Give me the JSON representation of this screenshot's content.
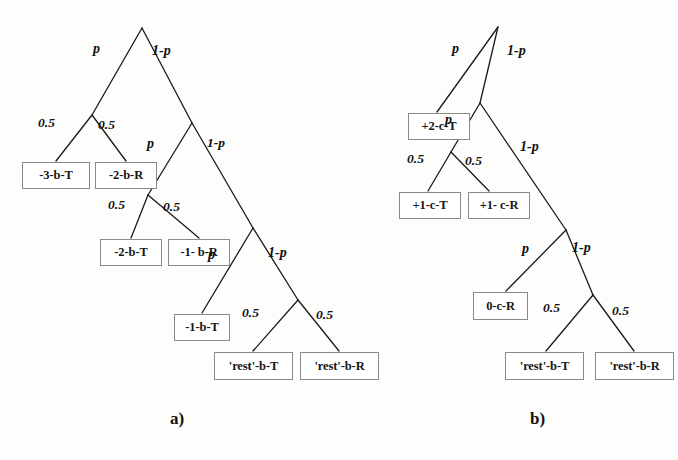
{
  "figure": {
    "width": 678,
    "height": 460,
    "background_color": "#fdfdfc",
    "line_color": "#1a1a1a",
    "box_border_color": "#8a8a86",
    "text_color": "#161616"
  },
  "panels": [
    {
      "id": "a",
      "caption": "a)",
      "caption_x": 170,
      "caption_y": 410,
      "nodes": [
        {
          "label": "-3-b-T",
          "x": 22,
          "y": 162,
          "w": 68,
          "h": 27
        },
        {
          "label": "-2-b-R",
          "x": 95,
          "y": 162,
          "w": 62,
          "h": 27
        },
        {
          "label": "-2-b-T",
          "x": 100,
          "y": 239,
          "w": 62,
          "h": 27
        },
        {
          "label": "-1- b-R",
          "x": 168,
          "y": 239,
          "w": 62,
          "h": 27
        },
        {
          "label": "-1-b-T",
          "x": 174,
          "y": 314,
          "w": 56,
          "h": 27
        },
        {
          "label": "'rest'-b-T",
          "x": 214,
          "y": 352,
          "w": 79,
          "h": 28
        },
        {
          "label": "'rest'-b-R",
          "x": 300,
          "y": 352,
          "w": 79,
          "h": 28
        }
      ],
      "edge_labels": [
        {
          "text": "p",
          "x": 93,
          "y": 42,
          "kind": "symbol"
        },
        {
          "text": "1-p",
          "x": 152,
          "y": 44,
          "kind": "symbol"
        },
        {
          "text": "0.5",
          "x": 38,
          "y": 116,
          "kind": "number"
        },
        {
          "text": "0.5",
          "x": 98,
          "y": 118,
          "kind": "number"
        },
        {
          "text": "p",
          "x": 147,
          "y": 137,
          "kind": "symbol"
        },
        {
          "text": "1-p",
          "x": 207,
          "y": 136,
          "kind": "number"
        },
        {
          "text": "0.5",
          "x": 108,
          "y": 198,
          "kind": "number"
        },
        {
          "text": "0.5",
          "x": 163,
          "y": 200,
          "kind": "number"
        },
        {
          "text": "p",
          "x": 208,
          "y": 248,
          "kind": "symbol"
        },
        {
          "text": "1-p",
          "x": 268,
          "y": 246,
          "kind": "symbol"
        },
        {
          "text": "0.5",
          "x": 242,
          "y": 306,
          "kind": "number"
        },
        {
          "text": "0.5",
          "x": 316,
          "y": 308,
          "kind": "number"
        }
      ],
      "edges": [
        {
          "x1": 142,
          "y1": 28,
          "x2": 92,
          "y2": 115
        },
        {
          "x1": 142,
          "y1": 28,
          "x2": 192,
          "y2": 123
        },
        {
          "x1": 92,
          "y1": 115,
          "x2": 56,
          "y2": 161
        },
        {
          "x1": 92,
          "y1": 115,
          "x2": 126,
          "y2": 161
        },
        {
          "x1": 192,
          "y1": 123,
          "x2": 148,
          "y2": 195
        },
        {
          "x1": 192,
          "y1": 123,
          "x2": 253,
          "y2": 228
        },
        {
          "x1": 148,
          "y1": 195,
          "x2": 131,
          "y2": 238
        },
        {
          "x1": 148,
          "y1": 195,
          "x2": 199,
          "y2": 238
        },
        {
          "x1": 253,
          "y1": 228,
          "x2": 202,
          "y2": 313
        },
        {
          "x1": 253,
          "y1": 228,
          "x2": 298,
          "y2": 300
        },
        {
          "x1": 298,
          "y1": 300,
          "x2": 253,
          "y2": 351
        },
        {
          "x1": 298,
          "y1": 300,
          "x2": 339,
          "y2": 351
        }
      ]
    },
    {
      "id": "b",
      "caption": "b)",
      "caption_x": 530,
      "caption_y": 410,
      "nodes": [
        {
          "label": "+2-c-T",
          "x": 408,
          "y": 113,
          "w": 62,
          "h": 27
        },
        {
          "label": "+1-c-T",
          "x": 399,
          "y": 192,
          "w": 62,
          "h": 27
        },
        {
          "label": "+1- c-R",
          "x": 468,
          "y": 192,
          "w": 62,
          "h": 27
        },
        {
          "label": "0-c-R",
          "x": 473,
          "y": 292,
          "w": 55,
          "h": 28
        },
        {
          "label": "'rest'-b-T",
          "x": 505,
          "y": 352,
          "w": 79,
          "h": 28
        },
        {
          "label": "'rest'-b-R",
          "x": 595,
          "y": 352,
          "w": 79,
          "h": 28
        }
      ],
      "edge_labels": [
        {
          "text": "p",
          "x": 452,
          "y": 42,
          "kind": "symbol"
        },
        {
          "text": "1-p",
          "x": 507,
          "y": 44,
          "kind": "symbol"
        },
        {
          "text": "p",
          "x": 445,
          "y": 113,
          "kind": "symbol"
        },
        {
          "text": "1-p",
          "x": 520,
          "y": 140,
          "kind": "symbol"
        },
        {
          "text": "0.5",
          "x": 407,
          "y": 152,
          "kind": "number"
        },
        {
          "text": "0.5",
          "x": 465,
          "y": 154,
          "kind": "number"
        },
        {
          "text": "p",
          "x": 522,
          "y": 242,
          "kind": "symbol"
        },
        {
          "text": "1-p",
          "x": 572,
          "y": 241,
          "kind": "symbol"
        },
        {
          "text": "0.5",
          "x": 543,
          "y": 301,
          "kind": "number"
        },
        {
          "text": "0.5",
          "x": 612,
          "y": 304,
          "kind": "number"
        }
      ],
      "edges": [
        {
          "x1": 498,
          "y1": 27,
          "x2": 437,
          "y2": 112
        },
        {
          "x1": 498,
          "y1": 27,
          "x2": 480,
          "y2": 103
        },
        {
          "x1": 480,
          "y1": 103,
          "x2": 451,
          "y2": 152
        },
        {
          "x1": 480,
          "y1": 103,
          "x2": 566,
          "y2": 230
        },
        {
          "x1": 451,
          "y1": 152,
          "x2": 428,
          "y2": 191
        },
        {
          "x1": 451,
          "y1": 152,
          "x2": 489,
          "y2": 191
        },
        {
          "x1": 566,
          "y1": 230,
          "x2": 506,
          "y2": 291
        },
        {
          "x1": 566,
          "y1": 230,
          "x2": 593,
          "y2": 295
        },
        {
          "x1": 593,
          "y1": 295,
          "x2": 546,
          "y2": 351
        },
        {
          "x1": 593,
          "y1": 295,
          "x2": 634,
          "y2": 351
        }
      ]
    }
  ]
}
